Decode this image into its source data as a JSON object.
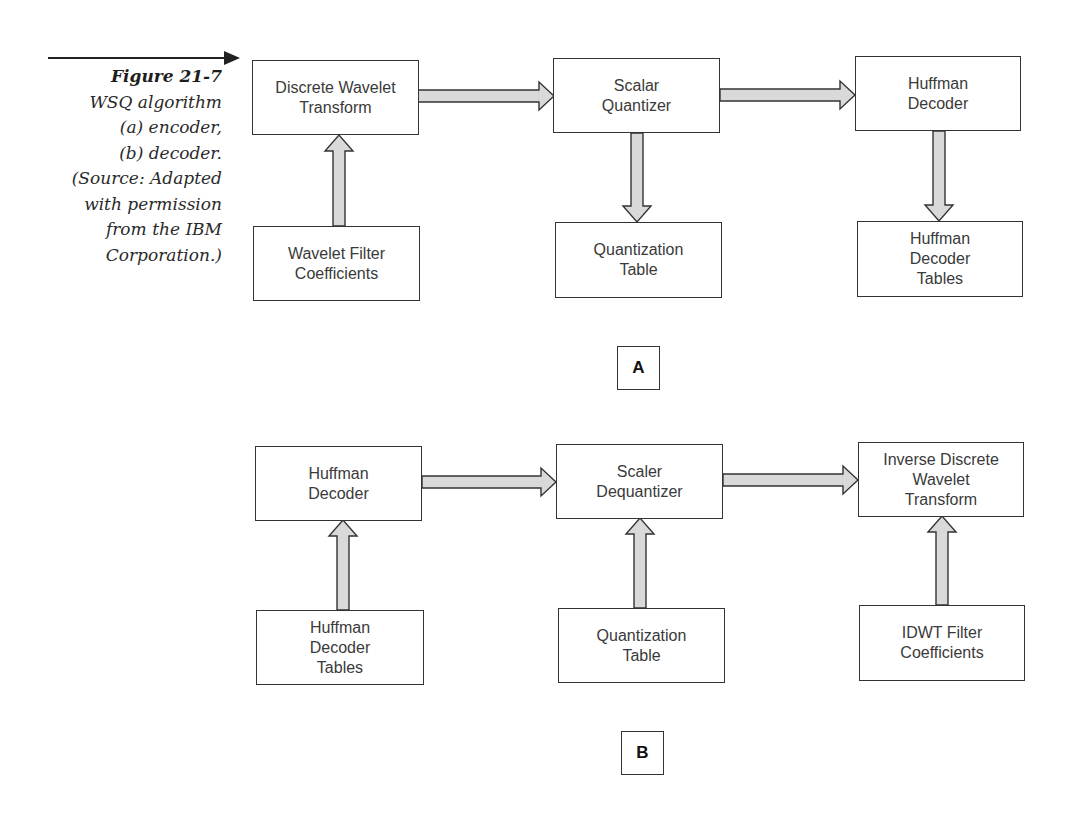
{
  "caption": {
    "title": "Figure 21-7",
    "lines": [
      "WSQ algorithm",
      "(a) encoder,",
      "(b) decoder.",
      "(Source: Adapted",
      "with permission",
      "from the IBM",
      "Corporation.)"
    ]
  },
  "diagram_a": {
    "label": "A",
    "boxes": {
      "dwt": "Discrete Wavelet\nTransform",
      "wavelet_filter": "Wavelet Filter\nCoefficients",
      "scalar_quantizer": "Scalar\nQuantizer",
      "quantization_table": "Quantization\nTable",
      "huffman_decoder": "Huffman\nDecoder",
      "huffman_tables": "Huffman\nDecoder\nTables"
    }
  },
  "diagram_b": {
    "label": "B",
    "boxes": {
      "huffman_decoder": "Huffman\nDecoder",
      "huffman_tables": "Huffman\nDecoder\nTables",
      "scaler_dequantizer": "Scaler\nDequantizer",
      "quantization_table": "Quantization\nTable",
      "idwt": "Inverse Discrete\nWavelet\nTransform",
      "idwt_filter": "IDWT Filter\nCoefficients"
    }
  },
  "colors": {
    "arrow_fill": "#d9d9d9",
    "stroke": "#333333"
  }
}
